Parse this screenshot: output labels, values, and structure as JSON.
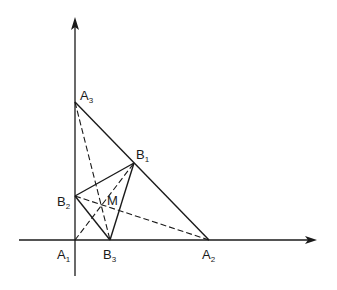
{
  "diagram": {
    "axes": {
      "x_axis": {
        "label": ""
      },
      "y_axis": {
        "label": ""
      }
    },
    "points": [
      {
        "id": "A1",
        "name": "A",
        "sub": "1"
      },
      {
        "id": "A2",
        "name": "A",
        "sub": "2"
      },
      {
        "id": "A3",
        "name": "A",
        "sub": "3"
      },
      {
        "id": "B1",
        "name": "B",
        "sub": "1"
      },
      {
        "id": "B2",
        "name": "B",
        "sub": "2"
      },
      {
        "id": "B3",
        "name": "B",
        "sub": "3"
      },
      {
        "id": "M",
        "name": "M",
        "sub": ""
      }
    ],
    "solid_segments": [
      [
        "A3",
        "A2"
      ],
      [
        "B1",
        "B2"
      ],
      [
        "B2",
        "B3"
      ],
      [
        "B3",
        "B1"
      ]
    ],
    "dashed_segments": [
      [
        "A3",
        "B3"
      ],
      [
        "B2",
        "A2"
      ],
      [
        "A1",
        "B1"
      ]
    ],
    "colors": {
      "ink": "#1a1a1a",
      "background": "#ffffff"
    }
  }
}
